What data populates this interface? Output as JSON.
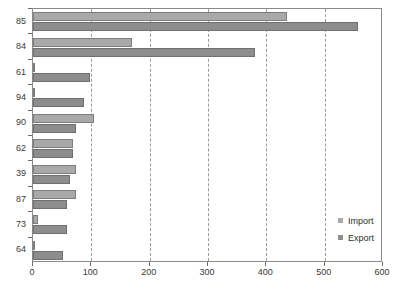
{
  "chart_data": {
    "type": "bar",
    "orientation": "horizontal",
    "title": "",
    "xlabel": "",
    "ylabel": "",
    "xlim": [
      0,
      600
    ],
    "ylim": null,
    "grid": true,
    "grid_axis": "x",
    "grid_style": "dashed",
    "legend_position": "lower-right",
    "xticks": [
      0,
      100,
      200,
      300,
      400,
      500,
      600
    ],
    "xticklabels": [
      "0",
      "100",
      "200",
      "300",
      "400",
      "500",
      "600"
    ],
    "categories": [
      "85",
      "84",
      "61",
      "94",
      "90",
      "62",
      "39",
      "87",
      "73",
      "64"
    ],
    "series": [
      {
        "name": "Import",
        "color": "#a9a9a9",
        "values": [
          436,
          169,
          3,
          4,
          104,
          68,
          73,
          74,
          8,
          2
        ]
      },
      {
        "name": "Export",
        "color": "#8d8d8d",
        "values": [
          557,
          381,
          97,
          88,
          74,
          68,
          63,
          59,
          58,
          52
        ]
      }
    ]
  },
  "legend": {
    "items": [
      {
        "label": "Import",
        "swatch": "import"
      },
      {
        "label": "Export",
        "swatch": "export"
      }
    ]
  },
  "colors": {
    "import": "#a9a9a9",
    "export": "#8d8d8d",
    "frame": "#8a8a8a",
    "grid": "#9a9a9a",
    "text": "#333333",
    "background": "#ffffff"
  }
}
